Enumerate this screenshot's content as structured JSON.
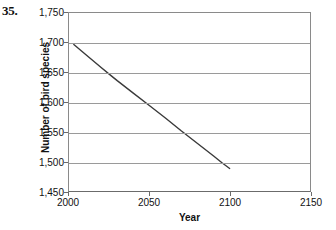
{
  "problem": {
    "number": "35."
  },
  "chart_data": {
    "type": "line",
    "title": "",
    "xlabel": "Year",
    "ylabel": "Number of bird species",
    "xlim": [
      2000,
      2150
    ],
    "ylim": [
      1450,
      1750
    ],
    "xticks": [
      2000,
      2050,
      2100,
      2150
    ],
    "xtick_labels": [
      "2000",
      "2050",
      "2100",
      "2150"
    ],
    "yticks": [
      1450,
      1500,
      1550,
      1600,
      1650,
      1700,
      1750
    ],
    "ytick_labels": [
      "1,450",
      "1,500",
      "1,550",
      "1,600",
      "1,650",
      "1,700",
      "1,750"
    ],
    "grid": "horizontal",
    "legend": "none",
    "line_color": "#3a3a3a",
    "grid_color": "#9a9a9a",
    "axis_color": "#6b6b6b",
    "background_color": "#ffffff",
    "series": [
      {
        "name": "Number of bird species",
        "x": [
          2003,
          2010,
          2020,
          2025,
          2030,
          2040,
          2050,
          2060,
          2070,
          2080,
          2090,
          2095,
          2100
        ],
        "y": [
          1697,
          1681,
          1658,
          1647,
          1636,
          1615,
          1594,
          1573,
          1551,
          1530,
          1509,
          1498,
          1488
        ]
      }
    ]
  }
}
